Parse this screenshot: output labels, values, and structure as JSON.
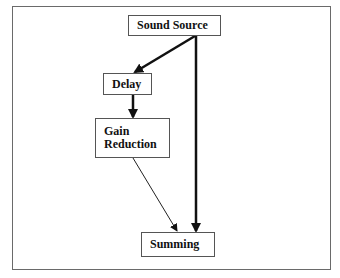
{
  "diagram": {
    "nodes": [
      {
        "id": "sound_source",
        "label": "Sound Source"
      },
      {
        "id": "delay",
        "label": "Delay"
      },
      {
        "id": "gain_reduction",
        "label": "Gain\nReduction"
      },
      {
        "id": "summing",
        "label": "Summing"
      }
    ],
    "edges": [
      {
        "from": "sound_source",
        "to": "delay",
        "weight": "thick"
      },
      {
        "from": "delay",
        "to": "gain_reduction",
        "weight": "thick"
      },
      {
        "from": "gain_reduction",
        "to": "summing",
        "weight": "thin"
      },
      {
        "from": "sound_source",
        "to": "summing",
        "weight": "thick"
      }
    ]
  }
}
